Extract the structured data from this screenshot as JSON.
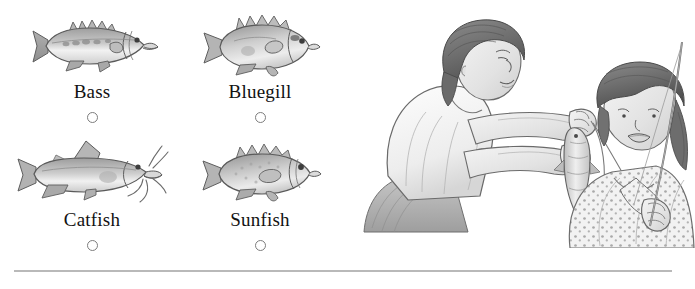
{
  "question": {
    "options": [
      {
        "id": "bass",
        "label": "Bass",
        "icon": "bass-fish-illustration",
        "selected": false
      },
      {
        "id": "bluegill",
        "label": "Bluegill",
        "icon": "bluegill-fish-illustration",
        "selected": false
      },
      {
        "id": "catfish",
        "label": "Catfish",
        "icon": "catfish-fish-illustration",
        "selected": false
      },
      {
        "id": "sunfish",
        "label": "Sunfish",
        "icon": "sunfish-fish-illustration",
        "selected": false
      }
    ]
  },
  "illustration": {
    "name": "woman-and-girl-fishing-illustration",
    "description": "Pencil sketch of a woman holding a caught fish on a line while a girl holding a fishing rod looks at it"
  },
  "divider": {
    "name": "bottom-divider",
    "color": "#b9b9b9"
  },
  "colors": {
    "background": "#ffffff",
    "text": "#121212",
    "radio_border": "#7d7d7d",
    "art_line": "#5a5a5a",
    "art_fill_light": "#e2e2e2",
    "art_fill_mid": "#c2c2c2",
    "art_fill_dark": "#9a9a9a"
  }
}
